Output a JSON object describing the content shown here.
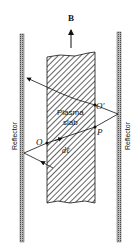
{
  "diagram": {
    "field_label": "B",
    "slab_label_line1": "Plasma",
    "slab_label_line2": "slab",
    "left_reflector_label": "Reflector",
    "right_reflector_label": "Reflector",
    "points": {
      "O": "O",
      "O_prime": "O′",
      "P": "P",
      "dl": "dℓ"
    }
  }
}
